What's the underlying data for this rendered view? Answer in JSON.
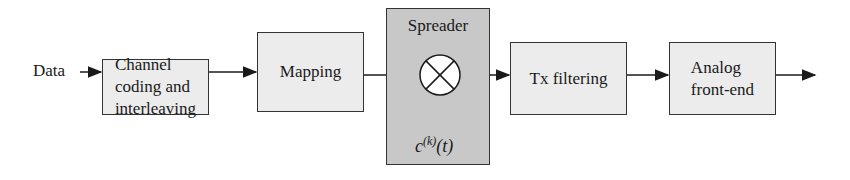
{
  "diagram": {
    "input_label": "Data",
    "blocks": [
      {
        "id": "channel-coding",
        "label": "Channel\ncoding and\ninterleaving"
      },
      {
        "id": "mapping",
        "label": "Mapping"
      },
      {
        "id": "spreader",
        "label": "Spreader",
        "multiplier_symbol": "⊗",
        "code_input": {
          "base": "c",
          "superscript": "(k)",
          "arg": "(t)"
        }
      },
      {
        "id": "tx-filtering",
        "label": "Tx filtering"
      },
      {
        "id": "analog-front-end",
        "label": "Analog\nfront-end"
      }
    ],
    "colors": {
      "block_fill": "#ececec",
      "spreader_fill": "#c8c8c8",
      "stroke": "#333333"
    }
  }
}
